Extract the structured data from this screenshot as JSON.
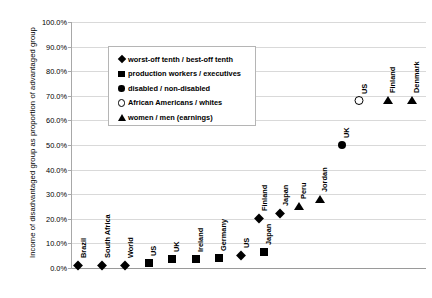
{
  "chart_data": {
    "type": "scatter",
    "title": "",
    "xlabel": "",
    "ylabel": "Income of disadvantaged group as proportion of advantaged group",
    "ylim": [
      0,
      100
    ],
    "ytick_labels": [
      "100.0%",
      "90.0%",
      "80.0%",
      "70.0%",
      "60.0%",
      "50.0%",
      "40.0%",
      "30.0%",
      "20.0%",
      "10.0%",
      "0.0%"
    ],
    "ytick_values": [
      100,
      90,
      80,
      70,
      60,
      50,
      40,
      30,
      20,
      10,
      0
    ],
    "grid": true,
    "legend_position": "upper-left-inside",
    "series": [
      {
        "name": "worst-off tenth / best-off tenth",
        "marker": "diamond",
        "points": [
          {
            "label": "Brazil",
            "value": 1.0
          },
          {
            "label": "South Africa",
            "value": 1.0
          },
          {
            "label": "World",
            "value": 1.0
          },
          {
            "label": "US",
            "value": 5.0
          },
          {
            "label": "Finland",
            "value": 20.0
          },
          {
            "label": "Japan",
            "value": 22.0
          }
        ]
      },
      {
        "name": "production workers / executives",
        "marker": "square",
        "points": [
          {
            "label": "US",
            "value": 2.0
          },
          {
            "label": "UK",
            "value": 3.5
          },
          {
            "label": "Ireland",
            "value": 3.5
          },
          {
            "label": "Germany",
            "value": 4.0
          },
          {
            "label": "Japan",
            "value": 6.5
          }
        ]
      },
      {
        "name": "disabled / non-disabled",
        "marker": "circle",
        "points": [
          {
            "label": "UK",
            "value": 50.0
          }
        ]
      },
      {
        "name": "African Americans / whites",
        "marker": "circle-open",
        "points": [
          {
            "label": "US",
            "value": 68.0
          }
        ]
      },
      {
        "name": "women / men (earnings)",
        "marker": "triangle",
        "points": [
          {
            "label": "Peru",
            "value": 25.0
          },
          {
            "label": "Jordan",
            "value": 28.0
          },
          {
            "label": "Finland",
            "value": 68.0
          },
          {
            "label": "Denmark",
            "value": 68.0
          }
        ]
      }
    ],
    "plotted_points": [
      {
        "label": "Brazil",
        "value": 1.0,
        "marker": "diamond",
        "x": 77
      },
      {
        "label": "South Africa",
        "value": 1.0,
        "marker": "diamond",
        "x": 101
      },
      {
        "label": "World",
        "value": 1.0,
        "marker": "diamond",
        "x": 124
      },
      {
        "label": "US",
        "value": 2.0,
        "marker": "square",
        "x": 148
      },
      {
        "label": "UK",
        "value": 3.5,
        "marker": "square",
        "x": 171
      },
      {
        "label": "Ireland",
        "value": 3.5,
        "marker": "square",
        "x": 195
      },
      {
        "label": "Germany",
        "value": 4.0,
        "marker": "square",
        "x": 218
      },
      {
        "label": "US",
        "value": 5.0,
        "marker": "diamond",
        "x": 240
      },
      {
        "label": "Japan",
        "value": 6.5,
        "marker": "square",
        "x": 263
      },
      {
        "label": "Finland",
        "value": 20.0,
        "marker": "diamond",
        "x": 258
      },
      {
        "label": "Japan",
        "value": 22.0,
        "marker": "diamond",
        "x": 279
      },
      {
        "label": "Peru",
        "value": 25.0,
        "marker": "triangle",
        "x": 298
      },
      {
        "label": "Jordan",
        "value": 28.0,
        "marker": "triangle",
        "x": 319
      },
      {
        "label": "UK",
        "value": 50.0,
        "marker": "circle",
        "x": 341
      },
      {
        "label": "US",
        "value": 68.0,
        "marker": "circle-open",
        "x": 358
      },
      {
        "label": "Finland",
        "value": 68.0,
        "marker": "triangle",
        "x": 387
      },
      {
        "label": "Denmark",
        "value": 68.0,
        "marker": "triangle",
        "x": 411
      }
    ]
  },
  "axis": {
    "y_title": "Income of disadvantaged group as proportion of advantaged group",
    "ticks": [
      "100.0%",
      "90.0%",
      "80.0%",
      "70.0%",
      "60.0%",
      "50.0%",
      "40.0%",
      "30.0%",
      "20.0%",
      "10.0%",
      "0.0%"
    ]
  },
  "legend": {
    "entries": [
      {
        "marker": "diamond",
        "label": "worst-off tenth / best-off tenth"
      },
      {
        "marker": "square",
        "label": "production workers / executives"
      },
      {
        "marker": "circle",
        "label": "disabled / non-disabled"
      },
      {
        "marker": "circle-open",
        "label": "African Americans / whites"
      },
      {
        "marker": "triangle",
        "label": "women / men (earnings)"
      }
    ]
  },
  "colors": {
    "marker": "#000000",
    "gridline": "#d9d9d9",
    "axis": "#a8a8a8",
    "background": "#ffffff"
  }
}
